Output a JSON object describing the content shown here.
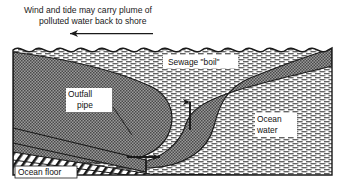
{
  "figure": {
    "title_lines": [
      "Wind and tide may carry plume of",
      "polluted water back to shore"
    ],
    "direction_arrow": "left-arrow-icon",
    "labels": {
      "sewage_boil": "Sewage \"boil\"",
      "outfall_pipe_line1": "Outfall",
      "outfall_pipe_line2": "pipe",
      "ocean_water_line1": "Ocean",
      "ocean_water_line2": "water",
      "ocean_floor": "Ocean floor"
    },
    "flow_arrows": {
      "vertical": "up-arrow-icon",
      "horizontal": "right-arrow-icon"
    },
    "colors": {
      "ink": "#1a1a1a",
      "plume_fill": "#8a8a8a",
      "pipe_fill": "#8a8a8a",
      "water_fill": "#ffffff",
      "seabed_fill": "#ffffff",
      "frame_stroke": "#1a1a1a",
      "background": "#ffffff"
    }
  }
}
